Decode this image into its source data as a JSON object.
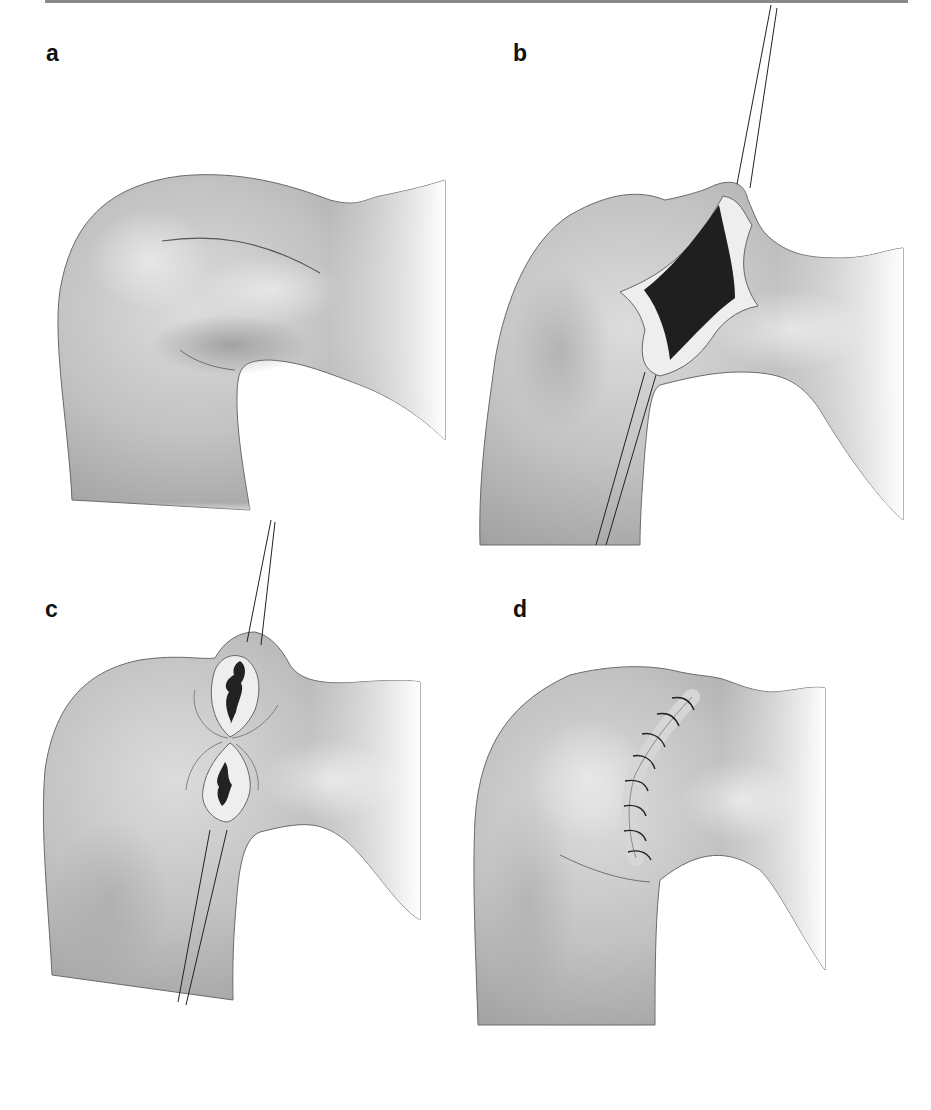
{
  "figure": {
    "panels": [
      {
        "id": "a",
        "label": "a",
        "description": "Shoulder with marked curved incision line"
      },
      {
        "id": "b",
        "label": "b",
        "description": "Diamond-shaped excised wound held open by retraction sutures"
      },
      {
        "id": "c",
        "label": "c",
        "description": "Wound approximated at center forming figure-of-eight with two smaller defects"
      },
      {
        "id": "d",
        "label": "d",
        "description": "Closed curved incision with interrupted sutures"
      }
    ],
    "sutures_count_panel_d": 8,
    "colors": {
      "skin_base": "#bdbdbd",
      "skin_highlight": "#d9d9d9",
      "skin_shadow": "#8f8f8f",
      "outline": "#5a5a5a",
      "wound_dark": "#1e1e1e",
      "wound_margin": "#ededed",
      "rule": "#8a8a8a"
    }
  }
}
